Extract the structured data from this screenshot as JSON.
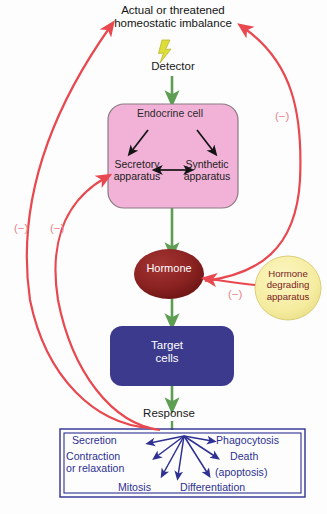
{
  "diagram": {
    "nodes": {
      "stimulus": {
        "label": "Actual or threatened\nhomeostatic imbalance"
      },
      "detector": {
        "label": "Detector",
        "icon": "lightning-bolt-icon"
      },
      "endocrine_cell": {
        "label": "Endocrine cell",
        "color": "#f2b2d8",
        "border": "#8a7a84",
        "sub_left": "Secretory\napparatus",
        "sub_right": "Synthetic\napparatus"
      },
      "hormone": {
        "label": "Hormone",
        "color": "#8b2322",
        "text_color": "#ffffff"
      },
      "hormone_degrading": {
        "label": "Hormone\ndegrading\napparatus",
        "color": "#f5eca0",
        "text_color": "#7a1c1c"
      },
      "target_cells": {
        "label": "Target\ncells",
        "color": "#3b3a8c",
        "text_color": "#ffffff"
      },
      "response": {
        "label": "Response"
      }
    },
    "response_box": {
      "border_color": "#2e3191",
      "outcomes": [
        {
          "label": "Secretion"
        },
        {
          "label": "Contraction\nor relaxation"
        },
        {
          "label": "Mitosis"
        },
        {
          "label": "Phagocytosis"
        },
        {
          "label": "Death"
        },
        {
          "label": "(apoptosis)"
        },
        {
          "label": "Differentiation"
        }
      ]
    },
    "feedback": {
      "sign_label": "(−)",
      "color": "#e8484f",
      "signs": [
        {
          "id": "left-outer",
          "label": "(−)"
        },
        {
          "id": "left-inner",
          "label": "(−)"
        },
        {
          "id": "right-upper",
          "label": "(−)"
        },
        {
          "id": "hormone-degrade",
          "label": "(−)"
        }
      ]
    },
    "flow_arrow_color": "#5e9e52",
    "inner_arrow_color": "#1a1a1a"
  }
}
